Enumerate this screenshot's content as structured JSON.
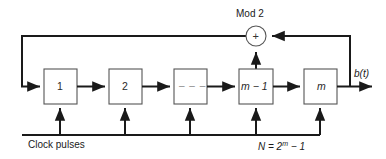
{
  "figure": {
    "title_label": "Mod 2",
    "output_label": "b(t)",
    "clock_label": "Clock pulses",
    "adder_symbol": "+",
    "length_formula": {
      "prefix": "N = 2",
      "exponent": "m",
      "suffix": " − 1"
    },
    "stages": [
      {
        "label": "1",
        "italic": false
      },
      {
        "label": "2",
        "italic": false
      },
      {
        "label": "– – –",
        "italic": false
      },
      {
        "label": "m − 1",
        "italic": true
      },
      {
        "label": "m",
        "italic": true
      }
    ],
    "colors": {
      "background": "#ffffff",
      "line": "#1a1a1a",
      "box_stroke": "#555555",
      "text": "#1a1a1a",
      "dash_text": "#8a8a8a"
    }
  }
}
